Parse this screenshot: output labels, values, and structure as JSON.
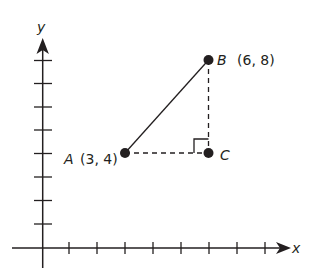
{
  "axes": {
    "x_label": "x",
    "y_label": "y",
    "origin_px": [
      42.7,
      248
    ],
    "unit_px": [
      28,
      23.5
    ],
    "x_ticks": [
      1,
      2,
      3,
      4,
      5,
      6,
      7,
      8
    ],
    "y_ticks": [
      1,
      2,
      3,
      4,
      5,
      6,
      7,
      8
    ]
  },
  "points": [
    {
      "name": "A",
      "coords_label": "(3, 4)",
      "x": 3,
      "y": 4
    },
    {
      "name": "B",
      "coords_label": "(6, 8)",
      "x": 6,
      "y": 8
    },
    {
      "name": "C",
      "coords_label": "",
      "x": 6,
      "y": 4
    }
  ],
  "segments": [
    {
      "from": "A",
      "to": "B",
      "style": "solid"
    },
    {
      "from": "A",
      "to": "C",
      "style": "dashed"
    },
    {
      "from": "B",
      "to": "C",
      "style": "dashed"
    }
  ],
  "right_angle_at": "C",
  "colors": {
    "ink": "#231f20",
    "background": "#ffffff"
  }
}
